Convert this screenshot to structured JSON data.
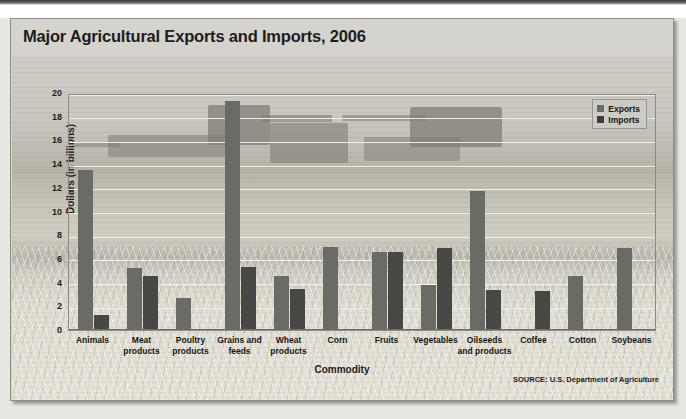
{
  "figure": {
    "title": "Major Agricultural Exports and Imports, 2006",
    "source": "SOURCE: U.S. Department of Agriculture"
  },
  "legend": {
    "position": "top-right",
    "entries": [
      {
        "label": "Exports",
        "color": "#6b6a64"
      },
      {
        "label": "Imports",
        "color": "#3f3e3a"
      }
    ]
  },
  "axes": {
    "ylabel": "Dollars (in billions)",
    "xlabel": "Commodity",
    "yticks": [
      "20",
      "18",
      "16",
      "14",
      "12",
      "10",
      "8",
      "6",
      "4",
      "2",
      "0"
    ]
  },
  "chart_data": {
    "type": "bar",
    "title": "Major Agricultural Exports and Imports, 2006",
    "xlabel": "Commodity",
    "ylabel": "Dollars (in billions)",
    "ylim": [
      0,
      20
    ],
    "ytick_step": 2,
    "grid": true,
    "legend_position": "upper right",
    "categories": [
      "Animals",
      "Meat products",
      "Poultry products",
      "Grains and feeds",
      "Wheat products",
      "Corn",
      "Fruits",
      "Vegetables",
      "Oilseeds and products",
      "Coffee",
      "Cotton",
      "Soybeans"
    ],
    "category_lines": [
      [
        "Animals"
      ],
      [
        "Meat",
        "products"
      ],
      [
        "Poultry",
        "products"
      ],
      [
        "Grains and",
        "feeds"
      ],
      [
        "Wheat",
        "products"
      ],
      [
        "Corn"
      ],
      [
        "Fruits"
      ],
      [
        "Vegetables"
      ],
      [
        "Oilseeds",
        "and products"
      ],
      [
        "Coffee"
      ],
      [
        "Cotton"
      ],
      [
        "Soybeans"
      ]
    ],
    "series": [
      {
        "name": "Exports",
        "color": "#6b6a64",
        "values": [
          13.5,
          5.2,
          2.7,
          19.3,
          4.6,
          7.0,
          6.6,
          3.8,
          11.7,
          0,
          4.6,
          6.9
        ]
      },
      {
        "name": "Imports",
        "color": "#484743",
        "values": [
          1.3,
          4.6,
          0,
          5.3,
          3.5,
          0,
          6.6,
          6.9,
          3.4,
          3.3,
          0,
          0
        ]
      }
    ]
  }
}
